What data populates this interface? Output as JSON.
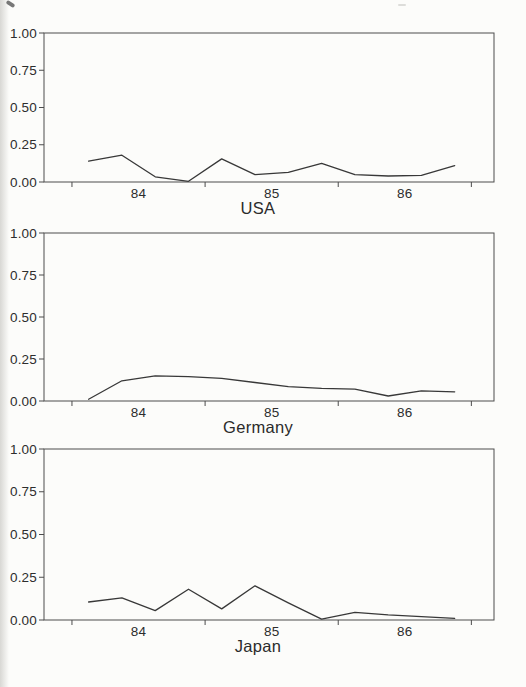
{
  "figure": {
    "background_color": "#fcfcfa",
    "ink_color": "#383838",
    "description_titles": [
      "USA",
      "Germany",
      "Japan"
    ]
  },
  "axes": {
    "y_tick_labels": [
      "1.00",
      "0.75",
      "0.50",
      "0.25",
      "0.00"
    ],
    "y_tick_values": [
      1.0,
      0.75,
      0.5,
      0.25,
      0.0
    ],
    "x_tick_labels": [
      "84",
      "85",
      "86"
    ],
    "x_tick_label_values": [
      84,
      85,
      86
    ],
    "x_axis_tick_values": [
      83.5,
      84.5,
      85.5,
      86.5
    ],
    "x_range": [
      83.29,
      86.67
    ],
    "y_range": [
      0,
      1
    ],
    "grid": "off",
    "legend": "none"
  },
  "chart_data": [
    {
      "type": "line",
      "title": "USA",
      "xlabel": "",
      "ylabel": "",
      "ylim": [
        0,
        1
      ],
      "x": [
        83.625,
        83.875,
        84.125,
        84.375,
        84.625,
        84.875,
        85.125,
        85.375,
        85.625,
        85.875,
        86.125,
        86.375
      ],
      "values": [
        0.14,
        0.18,
        0.035,
        0.005,
        0.155,
        0.05,
        0.065,
        0.125,
        0.05,
        0.04,
        0.045,
        0.11
      ]
    },
    {
      "type": "line",
      "title": "Germany",
      "xlabel": "",
      "ylabel": "",
      "ylim": [
        0,
        1
      ],
      "x": [
        83.625,
        83.875,
        84.125,
        84.375,
        84.625,
        84.875,
        85.125,
        85.375,
        85.625,
        85.875,
        86.125,
        86.375
      ],
      "values": [
        0.01,
        0.12,
        0.15,
        0.145,
        0.135,
        0.11,
        0.085,
        0.075,
        0.07,
        0.03,
        0.06,
        0.055
      ]
    },
    {
      "type": "line",
      "title": "Japan",
      "xlabel": "",
      "ylabel": "",
      "ylim": [
        0,
        1
      ],
      "x": [
        83.625,
        83.875,
        84.125,
        84.375,
        84.625,
        84.875,
        85.125,
        85.375,
        85.625,
        85.875,
        86.125,
        86.375
      ],
      "values": [
        0.105,
        0.13,
        0.055,
        0.18,
        0.065,
        0.2,
        0.1,
        0.005,
        0.045,
        0.03,
        0.02,
        0.01
      ]
    }
  ]
}
